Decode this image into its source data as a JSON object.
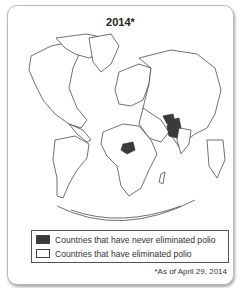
{
  "title": "2014*",
  "map": {
    "projection": "polar azimuthal world map",
    "highlighted_countries": [
      "Pakistan",
      "Afghanistan",
      "Nigeria"
    ],
    "colors": {
      "never_eliminated": "#3a3a3a",
      "eliminated": "#ffffff",
      "border": "#333333"
    }
  },
  "legend": {
    "items": [
      {
        "label": "Countries that have never eliminated polio",
        "color": "#3a3a3a"
      },
      {
        "label": "Countries that have eliminated polio",
        "color": "#ffffff"
      }
    ]
  },
  "footnote": "*As of April 29, 2014"
}
